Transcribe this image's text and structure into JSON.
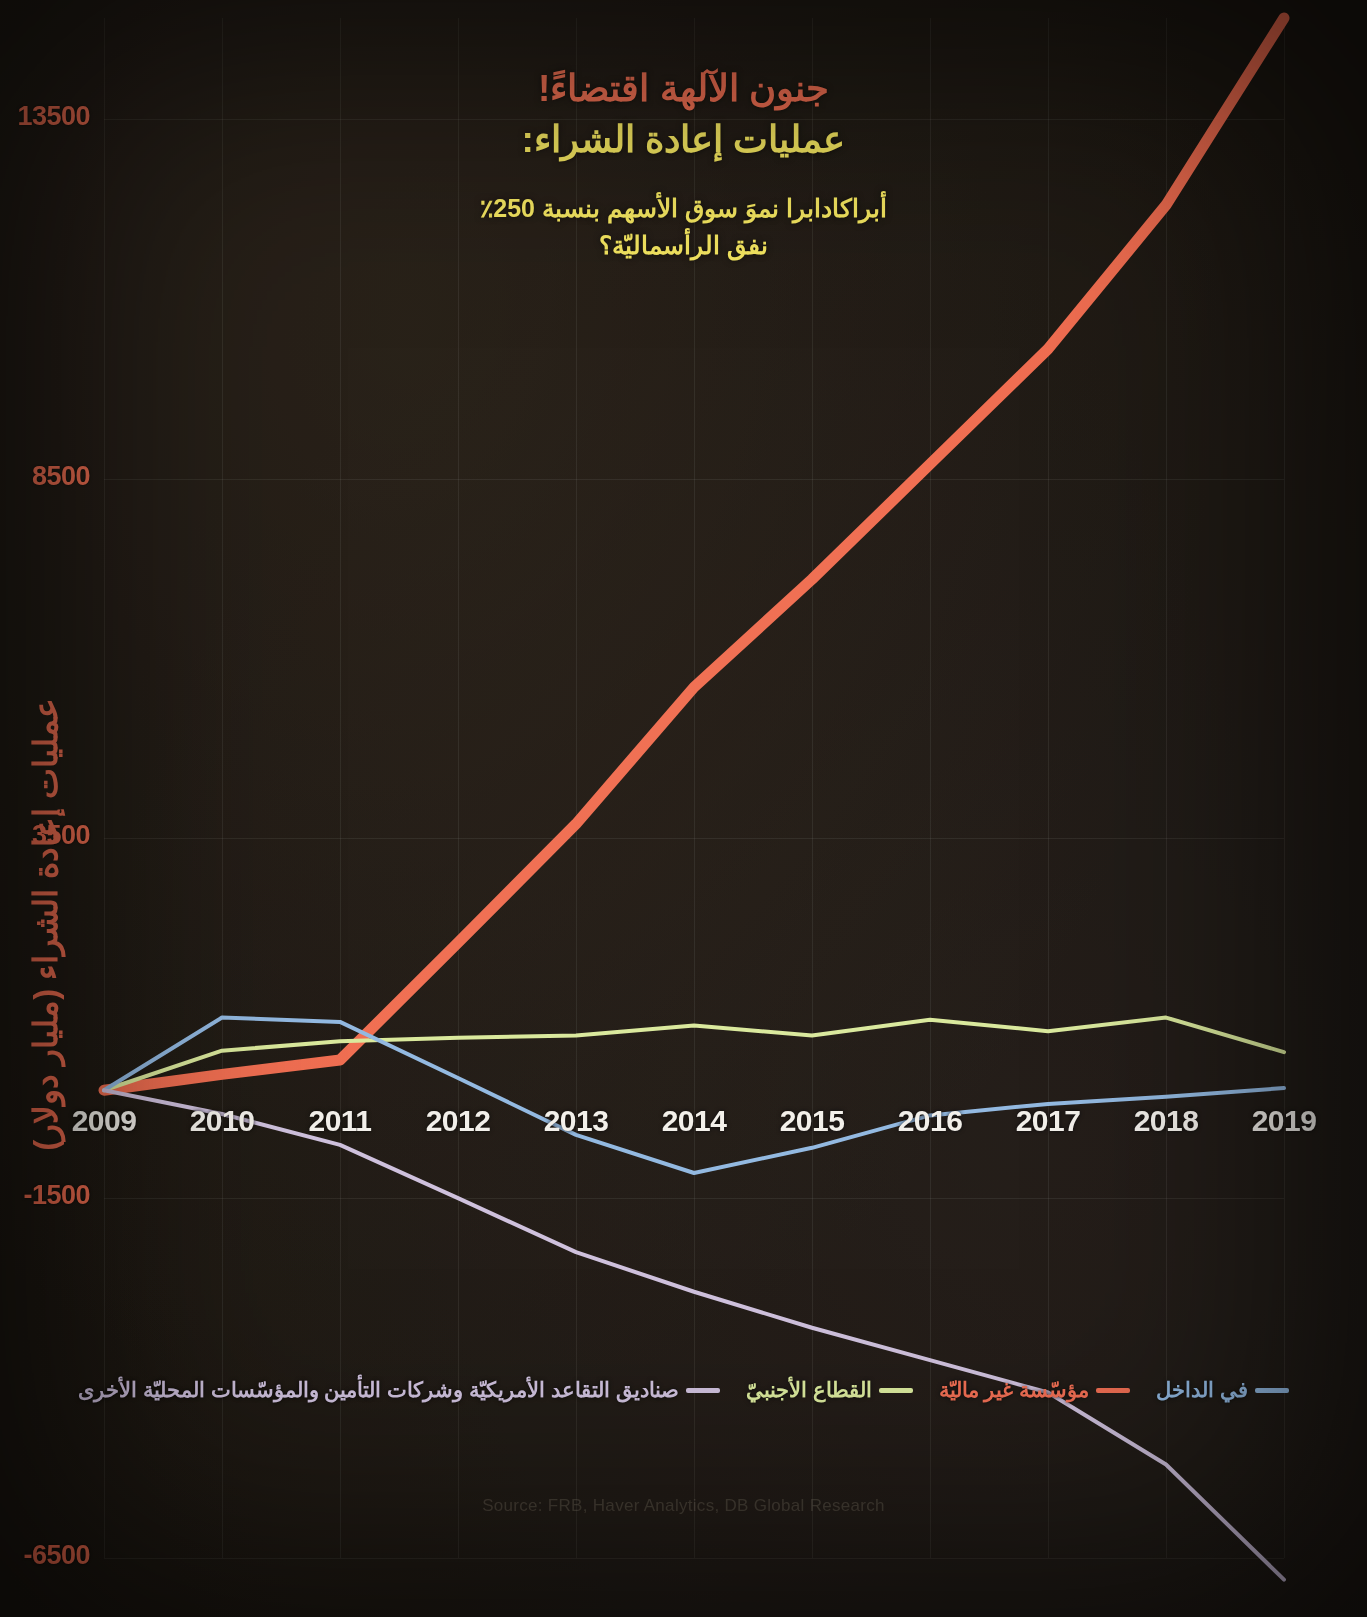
{
  "titles": {
    "line1": "جنون الآلهة اقتضاءً!",
    "line2": "عمليات إعادة الشراء:",
    "subtitle_line1": "أبراكادابرا نموَ سوق الأسهم بنسبة 250٪",
    "subtitle_line2": "نفق الرأسماليّة؟"
  },
  "axes": {
    "ylabel": "عمليات إعادة الشراء (مليار دولار)",
    "yticks": [
      "13500",
      "8500",
      "3500",
      "-1500",
      "-6500"
    ],
    "xticks": [
      "2009",
      "2010",
      "2011",
      "2012",
      "2013",
      "2014",
      "2015",
      "2016",
      "2017",
      "2018",
      "2019"
    ]
  },
  "legend": [
    {
      "label": "صناديق التقاعد الأمريكيّة وشركات التأمين والمؤسّسات المحليّة الأخرى",
      "color": "#cdbfdc"
    },
    {
      "label": "القطاع الأجنبيّ",
      "color": "#d9e89a"
    },
    {
      "label": "مؤسّسة غير ماليّة",
      "color": "#ef6b4e"
    },
    {
      "label": "في الداخل",
      "color": "#8fb7e0"
    }
  ],
  "source": "Source: FRB, Haver Analytics, DB Global Research",
  "colors": {
    "accent_red": "#ef6b4e",
    "accent_yellow": "#f3e45c",
    "green": "#d9e89a",
    "blue": "#8fb7e0",
    "purple": "#cdbfdc",
    "background": "#1c1711"
  },
  "chart_data": {
    "type": "line",
    "title": "عمليات إعادة الشراء:",
    "xlabel": "",
    "ylabel": "عمليات إعادة الشراء (مليار دولار)",
    "x": [
      2009,
      2010,
      2011,
      2012,
      2013,
      2014,
      2015,
      2016,
      2017,
      2018,
      2019
    ],
    "ylim": [
      -6500,
      14900
    ],
    "xlim": [
      2009,
      2019
    ],
    "yticks": [
      -6500,
      -1500,
      3500,
      8500,
      13500
    ],
    "grid": true,
    "legend_position": "bottom",
    "series": [
      {
        "name": "مؤسّسة غير ماليّة",
        "color": "#ef6b4e",
        "values": [
          0,
          220,
          420,
          2050,
          3700,
          5600,
          7100,
          8700,
          10300,
          12300,
          14900
        ]
      },
      {
        "name": "القطاع الأجنبيّ",
        "color": "#d9e89a",
        "values": [
          0,
          550,
          680,
          730,
          760,
          900,
          760,
          980,
          820,
          1010,
          530
        ]
      },
      {
        "name": "في الداخل",
        "color": "#8fb7e0",
        "values": [
          0,
          1010,
          950,
          170,
          -620,
          -1150,
          -800,
          -350,
          -190,
          -90,
          30
        ]
      },
      {
        "name": "صناديق التقاعد الأمريكيّة وشركات التأمين والمؤسّسات المحليّة الأخرى",
        "color": "#cdbfdc",
        "values": [
          0,
          -330,
          -760,
          -1500,
          -2250,
          -2800,
          -3300,
          -3750,
          -4200,
          -5200,
          -6800
        ]
      }
    ]
  }
}
